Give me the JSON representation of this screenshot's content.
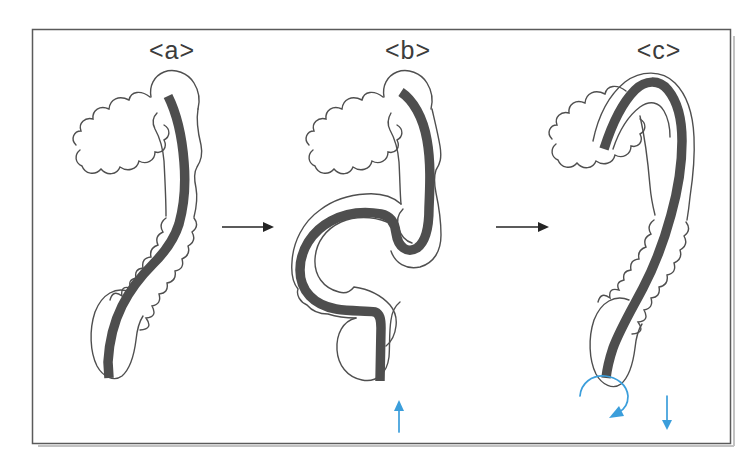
{
  "figure": {
    "panels": [
      {
        "id": "a",
        "label": "<a>"
      },
      {
        "id": "b",
        "label": "<b>"
      },
      {
        "id": "c",
        "label": "<c>"
      }
    ],
    "transition_arrows": [
      {
        "from": "a",
        "to": "b",
        "icon": "right-arrow-icon"
      },
      {
        "from": "b",
        "to": "c",
        "icon": "right-arrow-icon"
      }
    ],
    "maneuver_arrows": [
      {
        "panel": "b",
        "icon": "up-arrow-icon",
        "meaning": "push scope inward"
      },
      {
        "panel": "c",
        "icon": "rotate-clockwise-arrow-icon",
        "meaning": "torque rotation"
      },
      {
        "panel": "c",
        "icon": "down-arrow-icon",
        "meaning": "pull scope back"
      }
    ]
  },
  "colors": {
    "background": "#ffffff",
    "frame_border": "#5a5a5a",
    "frame_shadow": "#c2c2c2",
    "outline": "#4f4f4f",
    "scope": "#4e4e4e",
    "accent_blue": "#3b9edb",
    "arrow_black": "#242424",
    "label_text": "#3c3c3c"
  }
}
